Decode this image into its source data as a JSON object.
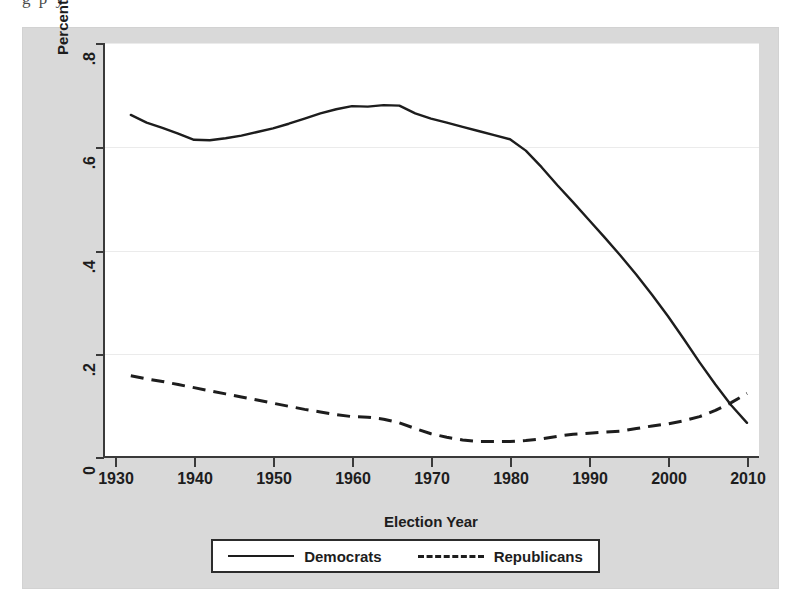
{
  "page": {
    "caption_remnant": "g  p y"
  },
  "chart_data": {
    "type": "line",
    "title": "",
    "xlabel": "Election Year",
    "ylabel": "Percent Cross-pressured/Moderate Members",
    "xlim": [
      1930,
      2010
    ],
    "ylim": [
      0,
      0.8
    ],
    "xticks": [
      1930,
      1940,
      1950,
      1960,
      1970,
      1980,
      1990,
      2000,
      2010
    ],
    "xtick_labels": [
      "1930",
      "1940",
      "1950",
      "1960",
      "1970",
      "1980",
      "1990",
      "2000",
      "2010"
    ],
    "yticks": [
      0,
      0.2,
      0.4,
      0.6,
      0.8
    ],
    "ytick_labels": [
      "0",
      ".2",
      ".4",
      ".6",
      ".8"
    ],
    "grid": true,
    "grid_axis": "y",
    "legend_position": "below-center",
    "series": [
      {
        "name": "Democrats",
        "style": "solid",
        "color": "#1d1d1d",
        "x": [
          1932,
          1934,
          1936,
          1938,
          1940,
          1942,
          1944,
          1946,
          1948,
          1950,
          1952,
          1954,
          1956,
          1958,
          1960,
          1962,
          1964,
          1966,
          1968,
          1970,
          1972,
          1974,
          1976,
          1978,
          1980,
          1982,
          1984,
          1986,
          1988,
          1990,
          1992,
          1994,
          1996,
          1998,
          2000,
          2002,
          2004,
          2006,
          2008,
          2010
        ],
        "values": [
          0.661,
          0.646,
          0.636,
          0.625,
          0.613,
          0.612,
          0.616,
          0.621,
          0.628,
          0.635,
          0.644,
          0.654,
          0.664,
          0.672,
          0.678,
          0.677,
          0.68,
          0.679,
          0.664,
          0.654,
          0.646,
          0.638,
          0.63,
          0.622,
          0.614,
          0.592,
          0.56,
          0.525,
          0.492,
          0.458,
          0.424,
          0.389,
          0.352,
          0.313,
          0.272,
          0.228,
          0.183,
          0.14,
          0.1,
          0.066
        ]
      },
      {
        "name": "Republicans",
        "style": "dashed",
        "color": "#1d1d1d",
        "x": [
          1932,
          1934,
          1936,
          1938,
          1940,
          1942,
          1944,
          1946,
          1948,
          1950,
          1952,
          1954,
          1956,
          1958,
          1960,
          1962,
          1964,
          1966,
          1968,
          1970,
          1972,
          1974,
          1976,
          1978,
          1980,
          1982,
          1984,
          1986,
          1988,
          1990,
          1992,
          1994,
          1996,
          1998,
          2000,
          2002,
          2004,
          2006,
          2008,
          2010
        ],
        "values": [
          0.157,
          0.151,
          0.146,
          0.14,
          0.134,
          0.128,
          0.122,
          0.116,
          0.11,
          0.104,
          0.098,
          0.092,
          0.087,
          0.082,
          0.078,
          0.077,
          0.073,
          0.066,
          0.055,
          0.045,
          0.038,
          0.033,
          0.03,
          0.03,
          0.03,
          0.032,
          0.035,
          0.04,
          0.044,
          0.046,
          0.048,
          0.05,
          0.055,
          0.06,
          0.064,
          0.07,
          0.078,
          0.09,
          0.105,
          0.123
        ]
      }
    ]
  },
  "legend": {
    "entries": [
      {
        "label": "Democrats",
        "style": "solid"
      },
      {
        "label": "Republicans",
        "style": "dashed"
      }
    ]
  }
}
